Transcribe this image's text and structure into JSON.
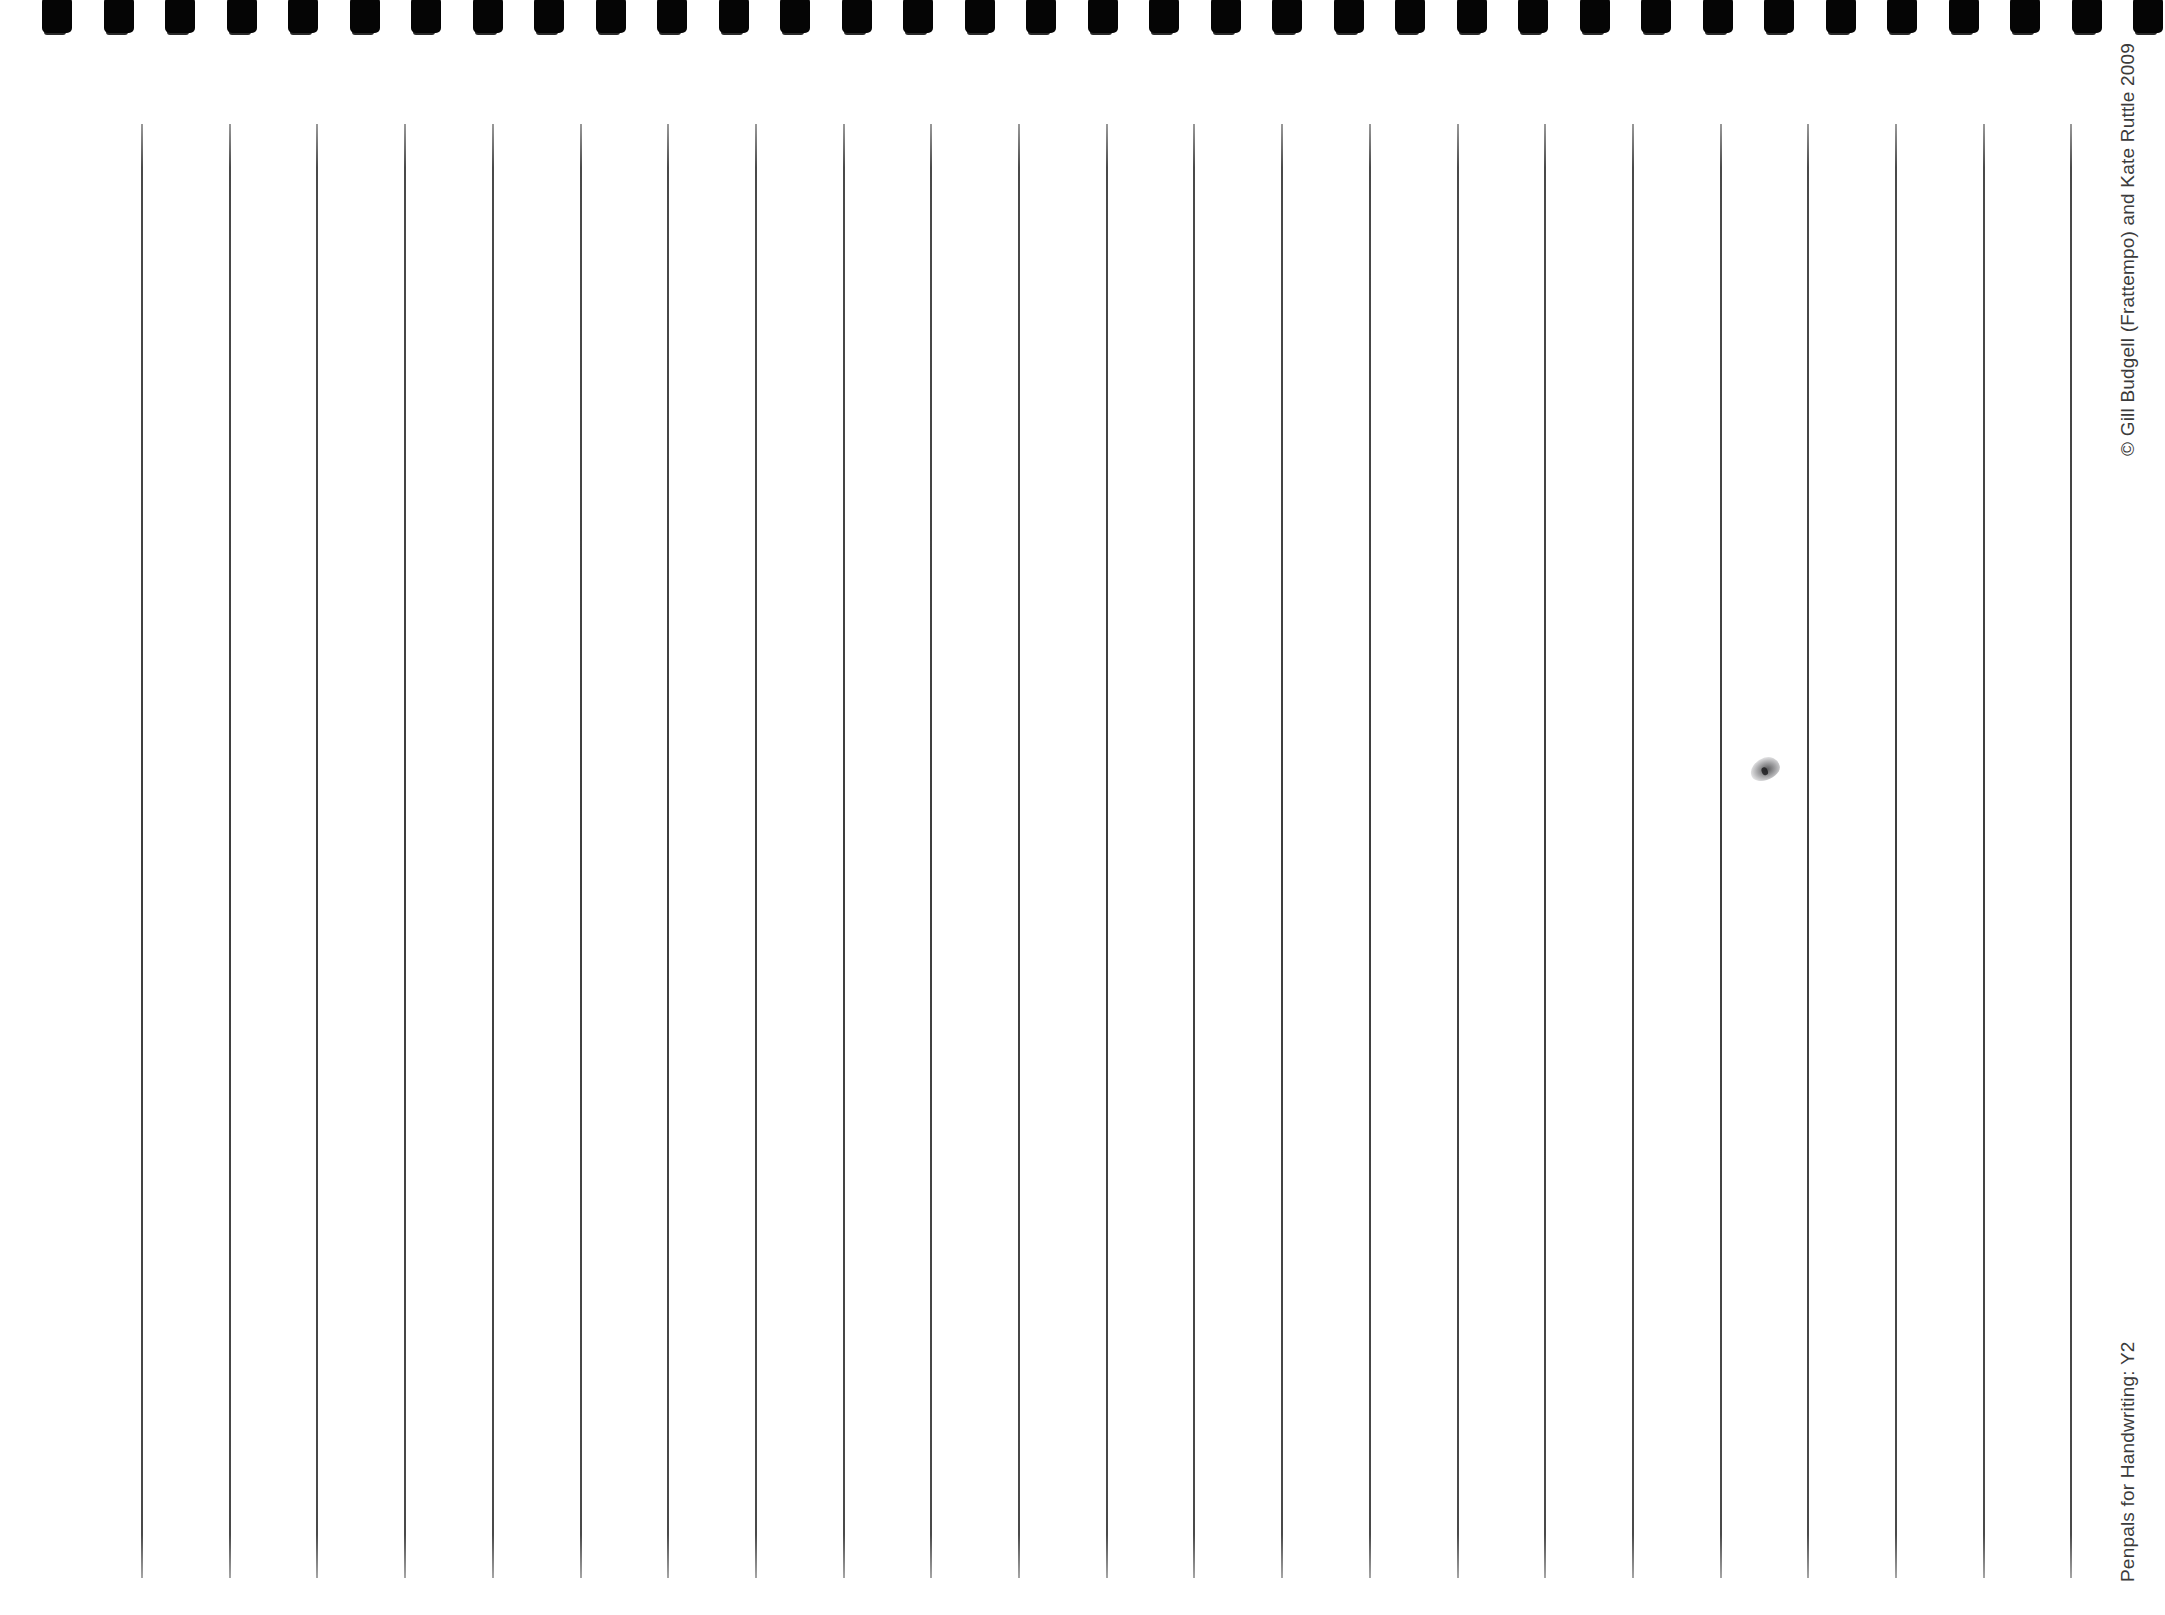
{
  "page": {
    "background_color": "#ffffff",
    "width": 2165,
    "height": 1615
  },
  "binding": {
    "name": "spiral-binding-holes",
    "hole_count": 35,
    "hole_color": "#050505",
    "first_hole_x": 42,
    "hole_spacing": 61.5,
    "hole_width": 30,
    "hole_height": 36
  },
  "ruling": {
    "name": "vertical-guide-lines",
    "line_count": 23,
    "first_line_x": 141,
    "line_spacing": 87.7,
    "line_top": 124,
    "line_bottom": 1578,
    "line_color": "#3d3d3d",
    "line_width": 2
  },
  "marks": {
    "smudge": {
      "label": "pencil-smudge",
      "x": 1765,
      "y": 769,
      "color": "#28282a"
    }
  },
  "margin_text": {
    "copyright": "© Gill Budgell (Frattempo) and Kate Ruttle 2009",
    "series": "Penpals for Handwriting: Y2",
    "text_color": "#3b3b3b"
  }
}
